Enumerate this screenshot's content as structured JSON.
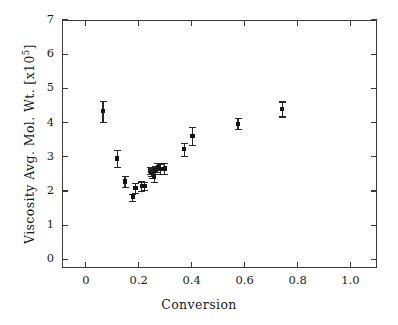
{
  "chart_data": {
    "type": "scatter",
    "title": "",
    "xlabel": "Conversion",
    "ylabel": "Viscosity Avg. Mol. Wt. [x10^5]",
    "ylabel_text": "Viscosity Avg. Mol. Wt. [x10",
    "ylabel_exponent": "5",
    "ylabel_suffix": "]",
    "xlim": [
      -0.09,
      1.1
    ],
    "ylim": [
      -0.25,
      7.0
    ],
    "xticks": [
      0,
      0.2,
      0.4,
      0.6,
      0.8,
      1.0
    ],
    "xticklabels": [
      "0",
      "0.2",
      "0.4",
      "0.6",
      "0.8",
      "1.0"
    ],
    "yticks": [
      0,
      1,
      2,
      3,
      4,
      5,
      6,
      7
    ],
    "yticklabels": [
      "0",
      "1",
      "2",
      "3",
      "4",
      "5",
      "6",
      "7"
    ],
    "grid": false,
    "legend": null,
    "marker_style": "filled-square",
    "marker_color": "#151515",
    "errorbar_color": "#262626",
    "frame_color": "#3a3a3a",
    "background": "#ffffff",
    "x": [
      0.065,
      0.118,
      0.148,
      0.178,
      0.188,
      0.212,
      0.222,
      0.243,
      0.248,
      0.252,
      0.258,
      0.263,
      0.272,
      0.282,
      0.298,
      0.372,
      0.403,
      0.575,
      0.742
    ],
    "y": [
      4.33,
      2.95,
      2.28,
      1.82,
      2.09,
      2.14,
      2.15,
      2.6,
      2.57,
      2.52,
      2.42,
      2.62,
      2.7,
      2.64,
      2.66,
      3.22,
      3.61,
      3.97,
      4.4
    ],
    "yerr": [
      0.3,
      0.24,
      0.17,
      0.1,
      0.14,
      0.14,
      0.12,
      0.11,
      0.12,
      0.13,
      0.16,
      0.12,
      0.13,
      0.14,
      0.15,
      0.19,
      0.27,
      0.16,
      0.22
    ],
    "points": [
      {
        "x": 0.065,
        "y": 4.33,
        "yerr": 0.3
      },
      {
        "x": 0.118,
        "y": 2.95,
        "yerr": 0.24
      },
      {
        "x": 0.148,
        "y": 2.28,
        "yerr": 0.17
      },
      {
        "x": 0.178,
        "y": 1.82,
        "yerr": 0.1
      },
      {
        "x": 0.188,
        "y": 2.09,
        "yerr": 0.14
      },
      {
        "x": 0.212,
        "y": 2.14,
        "yerr": 0.14
      },
      {
        "x": 0.222,
        "y": 2.15,
        "yerr": 0.12
      },
      {
        "x": 0.243,
        "y": 2.6,
        "yerr": 0.11
      },
      {
        "x": 0.248,
        "y": 2.57,
        "yerr": 0.12
      },
      {
        "x": 0.252,
        "y": 2.52,
        "yerr": 0.13
      },
      {
        "x": 0.258,
        "y": 2.42,
        "yerr": 0.16
      },
      {
        "x": 0.263,
        "y": 2.62,
        "yerr": 0.12
      },
      {
        "x": 0.272,
        "y": 2.7,
        "yerr": 0.13
      },
      {
        "x": 0.282,
        "y": 2.64,
        "yerr": 0.14
      },
      {
        "x": 0.298,
        "y": 2.66,
        "yerr": 0.15
      },
      {
        "x": 0.372,
        "y": 3.22,
        "yerr": 0.19
      },
      {
        "x": 0.403,
        "y": 3.61,
        "yerr": 0.27
      },
      {
        "x": 0.575,
        "y": 3.97,
        "yerr": 0.16
      },
      {
        "x": 0.742,
        "y": 4.4,
        "yerr": 0.22
      }
    ]
  }
}
